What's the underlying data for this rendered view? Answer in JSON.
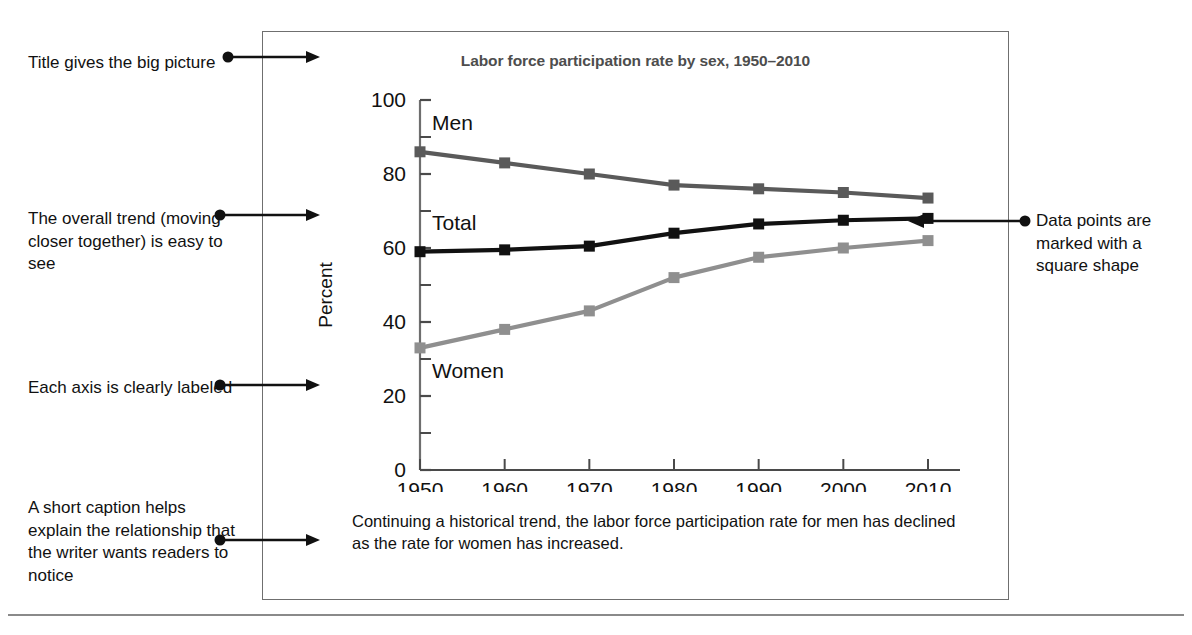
{
  "figure": {
    "title": "Labor force participation rate by sex, 1950–2010",
    "caption": "Continuing a historical trend, the labor force participation rate for men has declined as the rate for women has increased."
  },
  "annotations": {
    "title_note": "Title gives the big picture",
    "trend_note": "The overall trend (moving closer together) is easy to see",
    "axis_note": "Each axis is clearly labeled",
    "caption_note": "A short caption helps explain the relationship that the writer wants readers to notice",
    "datapoints_note": "Data points are marked with a square shape"
  },
  "chart_data": {
    "type": "line",
    "title": "Labor force participation rate by sex, 1950–2010",
    "xlabel": "",
    "ylabel": "Percent",
    "x": [
      1950,
      1960,
      1970,
      1980,
      1990,
      2000,
      2010
    ],
    "xticklabels": [
      "1950",
      "1960",
      "1970",
      "1980",
      "1990",
      "2000",
      "2010"
    ],
    "yticklabels": [
      "0",
      "20",
      "40",
      "60",
      "80",
      "100"
    ],
    "yticks": [
      0,
      20,
      40,
      60,
      80,
      100
    ],
    "yminorticks": [
      10,
      30,
      50,
      70,
      90
    ],
    "ylim": [
      0,
      100
    ],
    "xlim": [
      1950,
      2010
    ],
    "grid": false,
    "legend": "inline-series-labels",
    "marker": "square",
    "series": [
      {
        "name": "Men",
        "label": "Men",
        "color": "#5a5a5a",
        "values": [
          86.0,
          83.0,
          80.0,
          77.0,
          76.0,
          75.0,
          73.5
        ]
      },
      {
        "name": "Total",
        "label": "Total",
        "color": "#111111",
        "values": [
          59.0,
          59.5,
          60.5,
          64.0,
          66.5,
          67.5,
          68.0
        ]
      },
      {
        "name": "Women",
        "label": "Women",
        "color": "#8f8f8f",
        "values": [
          33.0,
          38.0,
          43.0,
          52.0,
          57.5,
          60.0,
          62.0
        ]
      }
    ]
  },
  "colors": {
    "men": "#5a5a5a",
    "total": "#111111",
    "women": "#8f8f8f",
    "title": "#4d4d4d",
    "box_border": "#6f6f6f",
    "rule": "#8a8a8a"
  }
}
